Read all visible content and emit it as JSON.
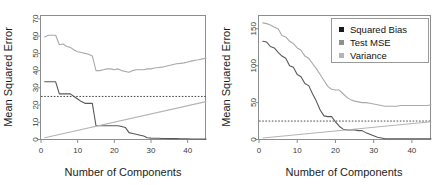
{
  "figure": {
    "background": "#ffffff",
    "panel_count": 2
  },
  "colors": {
    "squared_bias": "#585858",
    "test_mse": "#a9a9a9",
    "variance": "#b4b4b4",
    "irreducible": "#4a4a4a",
    "axis": "#8d8d8d",
    "text": "#1c1c1c",
    "tick_text": "#3b3b3b"
  },
  "legend": {
    "present_on": "right",
    "items": [
      {
        "label": "Squared Bias",
        "marker": "square",
        "color": "#1a1a1a"
      },
      {
        "label": "Test MSE",
        "marker": "square",
        "color": "#8f8f8f"
      },
      {
        "label": "Variance",
        "marker": "square",
        "color": "#b4b4b4"
      }
    ]
  },
  "chart_data": [
    {
      "id": "left-panel",
      "type": "line",
      "title": "",
      "xlabel": "Number of Components",
      "ylabel": "Mean Squared Error",
      "xlim": [
        0,
        45
      ],
      "ylim": [
        0,
        72
      ],
      "xticks": [
        0,
        10,
        20,
        30,
        40
      ],
      "yticks": [
        0,
        10,
        20,
        30,
        40,
        50,
        60,
        70
      ],
      "grid": false,
      "legend": false,
      "annotations": [
        {
          "kind": "hline",
          "label": "Irreducible error",
          "y": 25,
          "style": "dotted"
        }
      ],
      "series": [
        {
          "name": "Test MSE",
          "color": "#a9a9a9",
          "x": [
            1,
            2,
            3,
            4,
            5,
            6,
            7,
            8,
            9,
            10,
            11,
            12,
            13,
            14,
            15,
            16,
            17,
            18,
            19,
            20,
            21,
            22,
            23,
            24,
            25,
            26,
            27,
            28,
            29,
            30,
            31,
            32,
            33,
            34,
            35,
            36,
            37,
            38,
            39,
            40,
            41,
            42,
            43,
            44,
            45
          ],
          "values": [
            59.5,
            60.5,
            60.5,
            60.5,
            55.0,
            55.5,
            54.0,
            53.5,
            52.0,
            51.0,
            50.5,
            50.0,
            49.5,
            48.5,
            40.0,
            40.0,
            40.5,
            41.0,
            41.0,
            40.5,
            41.0,
            40.0,
            39.5,
            39.0,
            40.0,
            40.5,
            40.5,
            40.5,
            41.0,
            41.0,
            41.5,
            41.8,
            42.0,
            42.5,
            43.0,
            43.5,
            44.0,
            44.2,
            44.5,
            45.0,
            45.5,
            46.0,
            46.3,
            46.8,
            47.2
          ]
        },
        {
          "name": "Squared Bias",
          "color": "#585858",
          "x": [
            1,
            2,
            3,
            4,
            5,
            6,
            7,
            8,
            9,
            10,
            11,
            12,
            13,
            14,
            15,
            16,
            17,
            18,
            19,
            20,
            21,
            22,
            23,
            24,
            25,
            26,
            27,
            28,
            29,
            30,
            31,
            32,
            33,
            34,
            35,
            36,
            37,
            38,
            39,
            40,
            41,
            42,
            43,
            44,
            45
          ],
          "values": [
            33.5,
            33.5,
            33.5,
            33.5,
            26.5,
            26.5,
            26.5,
            26.5,
            25.0,
            23.5,
            22.0,
            21.0,
            21.0,
            21.0,
            8.0,
            8.0,
            8.0,
            8.0,
            8.0,
            8.0,
            8.0,
            7.5,
            7.0,
            4.0,
            3.5,
            3.0,
            2.5,
            2.0,
            1.0,
            0.8,
            0.7,
            0.7,
            0.6,
            0.6,
            0.5,
            0.5,
            0.5,
            0.4,
            0.4,
            0.4,
            0.3,
            0.3,
            0.3,
            0.3,
            0.2
          ]
        },
        {
          "name": "Variance",
          "color": "#b4b4b4",
          "x": [
            1,
            45
          ],
          "values": [
            1.0,
            22.0
          ]
        }
      ]
    },
    {
      "id": "right-panel",
      "type": "line",
      "title": "",
      "xlabel": "Number of Components",
      "ylabel": "Mean Squared Error",
      "xlim": [
        0,
        45
      ],
      "ylim": [
        0,
        168
      ],
      "xticks": [
        0,
        10,
        20,
        30,
        40
      ],
      "yticks": [
        0,
        50,
        100,
        150
      ],
      "grid": false,
      "legend": true,
      "annotations": [
        {
          "kind": "hline",
          "label": "Irreducible error",
          "y": 25,
          "style": "dotted"
        }
      ],
      "series": [
        {
          "name": "Test MSE",
          "color": "#a9a9a9",
          "x": [
            1,
            2,
            3,
            4,
            5,
            6,
            7,
            8,
            9,
            10,
            11,
            12,
            13,
            14,
            15,
            16,
            17,
            18,
            19,
            20,
            21,
            22,
            23,
            24,
            25,
            26,
            27,
            28,
            29,
            30,
            31,
            32,
            33,
            34,
            35,
            36,
            37,
            38,
            39,
            40,
            41,
            42,
            43,
            44,
            45
          ],
          "values": [
            158,
            157,
            155,
            152,
            150,
            141,
            139,
            133,
            130,
            124,
            121,
            113,
            110,
            103,
            96,
            88,
            80,
            72,
            68,
            67,
            67,
            62,
            57,
            54,
            52,
            51,
            50,
            50,
            49,
            48,
            47,
            46,
            45,
            45,
            45,
            45,
            46,
            46,
            46,
            46,
            46,
            46,
            46,
            46,
            47
          ]
        },
        {
          "name": "Squared Bias",
          "color": "#585858",
          "x": [
            1,
            2,
            3,
            4,
            5,
            6,
            7,
            8,
            9,
            10,
            11,
            12,
            13,
            14,
            15,
            16,
            17,
            18,
            19,
            20,
            21,
            22,
            23,
            24,
            25,
            26,
            27,
            28,
            29,
            30,
            31,
            32,
            33,
            34,
            35,
            36,
            37,
            38,
            39,
            40,
            41,
            42,
            43,
            44,
            45
          ],
          "values": [
            133,
            132,
            126,
            124,
            118,
            113,
            110,
            100,
            98,
            88,
            85,
            76,
            73,
            62,
            52,
            40,
            32,
            31,
            31,
            24,
            18,
            14,
            13,
            13,
            13,
            12,
            12,
            9,
            7,
            5,
            3,
            2,
            1,
            1,
            1,
            1,
            1,
            1,
            1,
            1,
            1,
            1,
            1,
            1,
            1
          ]
        },
        {
          "name": "Variance",
          "color": "#b4b4b4",
          "x": [
            1,
            45
          ],
          "values": [
            2.0,
            24.0
          ]
        }
      ]
    }
  ]
}
